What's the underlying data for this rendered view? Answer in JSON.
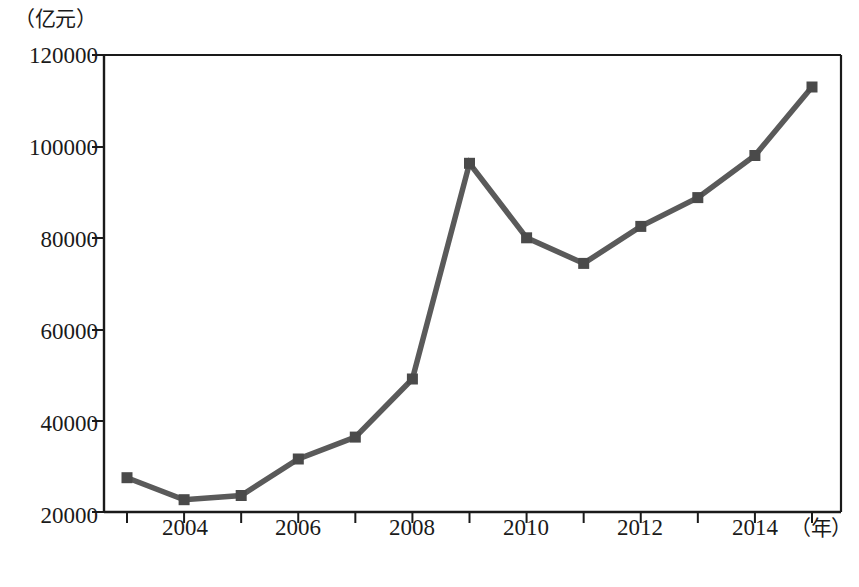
{
  "chart_data": {
    "type": "line",
    "title": "",
    "subtitle": "",
    "xlabel": "（年）",
    "ylabel": "（亿元）",
    "categories": [
      "2003",
      "2004",
      "2005",
      "2006",
      "2007",
      "2008",
      "2009",
      "2010",
      "2011",
      "2012",
      "2013",
      "2014",
      "2015"
    ],
    "x": [
      2003,
      2004,
      2005,
      2006,
      2007,
      2008,
      2009,
      2010,
      2011,
      2012,
      2013,
      2014,
      2015
    ],
    "values": [
      27500,
      22700,
      23600,
      31600,
      36400,
      49100,
      96300,
      80000,
      74400,
      82500,
      88800,
      98000,
      113000
    ],
    "series": [
      {
        "name": "",
        "values": [
          27500,
          22700,
          23600,
          31600,
          36400,
          49100,
          96300,
          80000,
          74400,
          82500,
          88800,
          98000,
          113000
        ]
      }
    ],
    "xlim": [
      2002.5,
      2015.5
    ],
    "ylim": [
      20000,
      120000
    ],
    "ytick_labels": [
      "20000",
      "40000",
      "60000",
      "80000",
      "100000",
      "120000"
    ],
    "ytick_values": [
      20000,
      40000,
      60000,
      80000,
      100000,
      120000
    ],
    "xtick_values": [
      2003,
      2004,
      2005,
      2006,
      2007,
      2008,
      2009,
      2010,
      2011,
      2012,
      2013,
      2014,
      2015
    ],
    "xtick_labels_shown": [
      "2004",
      "2006",
      "2008",
      "2010",
      "2012",
      "2014"
    ],
    "grid": false,
    "legend": "none",
    "marker": "square",
    "line_color": "#5a5a5a",
    "marker_color": "#4a4a4a",
    "axis_color": "#1a1a1a"
  },
  "axes": {
    "y_unit": "（亿元）",
    "x_unit": "（年）",
    "y_ticks": [
      {
        "label": "120000",
        "value": 120000
      },
      {
        "label": "100000",
        "value": 100000
      },
      {
        "label": "80000",
        "value": 80000
      },
      {
        "label": "60000",
        "value": 60000
      },
      {
        "label": "40000",
        "value": 40000
      },
      {
        "label": "20000",
        "value": 20000
      }
    ],
    "x_ticks": [
      {
        "label": "2004",
        "value": 2004
      },
      {
        "label": "2006",
        "value": 2006
      },
      {
        "label": "2008",
        "value": 2008
      },
      {
        "label": "2010",
        "value": 2010
      },
      {
        "label": "2012",
        "value": 2012
      },
      {
        "label": "2014",
        "value": 2014
      }
    ]
  },
  "caption": {
    "text": ""
  }
}
